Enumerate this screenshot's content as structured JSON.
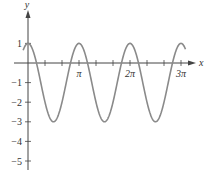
{
  "chart_data": {
    "type": "line",
    "title": "",
    "xlabel": "x",
    "ylabel": "y",
    "function": "y = 2cos(2x) - 1",
    "x_range": [
      -0.3,
      9.7
    ],
    "xlim": [
      -0.6,
      10.1
    ],
    "ylim": [
      -5.3,
      2.4
    ],
    "x_tick_labels": [
      "π",
      "2π",
      "3π"
    ],
    "x_tick_values": [
      3.14159,
      6.28319,
      9.42478
    ],
    "x_minor_tick_step": "π/3",
    "y_tick_labels": [
      "1",
      "−1",
      "−2",
      "−3",
      "−4",
      "−5"
    ],
    "y_tick_values": [
      1,
      -1,
      -2,
      -3,
      -4,
      -5
    ],
    "series": [
      {
        "name": "curve",
        "color": "#8a8a8a",
        "x": [
          0,
          0.7854,
          1.5708,
          2.3562,
          3.1416,
          3.927,
          4.7124,
          5.4978,
          6.2832,
          7.0686,
          7.854,
          8.6394,
          9.4248
        ],
        "values": [
          1,
          -1,
          -3,
          -1,
          1,
          -1,
          -3,
          -1,
          1,
          -1,
          -3,
          -1,
          1
        ]
      }
    ],
    "grid": false,
    "legend": "none"
  },
  "axes": {
    "x_label": "x",
    "y_label": "y",
    "axis_color": "#444444"
  }
}
